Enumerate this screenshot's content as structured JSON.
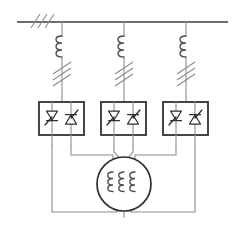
{
  "diagram": {
    "type": "electrical-schematic",
    "canvas": {
      "width": 245,
      "height": 227
    },
    "stroke_colors": {
      "wire": "#8c8c8c",
      "bus": "#6e6e6e",
      "box": "#3c3c3c",
      "symbol": "#2e2e2e",
      "coil": "#4a4a4a",
      "background": "#ffffff"
    },
    "supply_bus": {
      "label": "",
      "x1": 17,
      "x2": 228,
      "y": 22,
      "phase_slash_count": 3,
      "phase_slash_x": 35
    },
    "phases": [
      {
        "name": "phase-a",
        "x": 62
      },
      {
        "name": "phase-b",
        "x": 124
      },
      {
        "name": "phase-c",
        "x": 186
      }
    ],
    "line_reactors": [
      {
        "name": "line-reactor-a",
        "x": 62,
        "y_top": 35,
        "arcs": 3
      },
      {
        "name": "line-reactor-b",
        "x": 124,
        "y_top": 35,
        "arcs": 3
      },
      {
        "name": "line-reactor-c",
        "x": 186,
        "y_top": 35,
        "arcs": 3
      }
    ],
    "disconnectors": [
      {
        "name": "disconnector-a",
        "x": 62,
        "y": 70,
        "slash_count": 3
      },
      {
        "name": "disconnector-b",
        "x": 124,
        "y": 70,
        "slash_count": 3
      },
      {
        "name": "disconnector-c",
        "x": 186,
        "y": 70,
        "slash_count": 3
      }
    ],
    "thyristor_modules": [
      {
        "name": "thyristor-module-a",
        "label": "",
        "x": 39,
        "y": 102,
        "width": 45,
        "height": 33,
        "devices": [
          {
            "name": "thyristor-a1",
            "orientation": "down"
          },
          {
            "name": "thyristor-a2",
            "orientation": "up"
          }
        ]
      },
      {
        "name": "thyristor-module-b",
        "label": "",
        "x": 101,
        "y": 102,
        "width": 45,
        "height": 33,
        "devices": [
          {
            "name": "thyristor-b1",
            "orientation": "down"
          },
          {
            "name": "thyristor-b2",
            "orientation": "up"
          }
        ]
      },
      {
        "name": "thyristor-module-c",
        "label": "",
        "x": 163,
        "y": 102,
        "width": 45,
        "height": 33,
        "devices": [
          {
            "name": "thyristor-c1",
            "orientation": "down"
          },
          {
            "name": "thyristor-c2",
            "orientation": "up"
          }
        ]
      }
    ],
    "machine": {
      "name": "three-phase-machine",
      "label": "",
      "cx": 124,
      "cy": 184,
      "radius": 27,
      "winding_count": 3,
      "winding_arcs": 3,
      "winding_x": [
        113,
        124,
        135
      ]
    }
  }
}
